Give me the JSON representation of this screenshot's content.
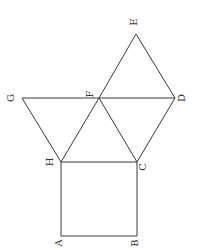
{
  "diagram": {
    "points": {
      "A": {
        "x": 61,
        "y": 236,
        "label": "A",
        "lx": 58,
        "ly": 243
      },
      "B": {
        "x": 137,
        "y": 236,
        "label": "B",
        "lx": 134,
        "ly": 243
      },
      "C": {
        "x": 137,
        "y": 162,
        "label": "C",
        "lx": 142,
        "ly": 167
      },
      "H": {
        "x": 61,
        "y": 162,
        "label": "H",
        "lx": 49,
        "ly": 162
      },
      "G": {
        "x": 22,
        "y": 98,
        "label": "G",
        "lx": 10,
        "ly": 98
      },
      "F": {
        "x": 99,
        "y": 98,
        "label": "F",
        "lx": 89,
        "ly": 94
      },
      "D": {
        "x": 175,
        "y": 98,
        "label": "D",
        "lx": 181,
        "ly": 98
      },
      "E": {
        "x": 136,
        "y": 34,
        "label": "E",
        "lx": 133,
        "ly": 22
      }
    },
    "segments": [
      [
        "A",
        "B"
      ],
      [
        "B",
        "C"
      ],
      [
        "C",
        "H"
      ],
      [
        "H",
        "A"
      ],
      [
        "G",
        "D"
      ],
      [
        "G",
        "H"
      ],
      [
        "H",
        "F"
      ],
      [
        "F",
        "C"
      ],
      [
        "C",
        "D"
      ],
      [
        "F",
        "E"
      ],
      [
        "E",
        "D"
      ]
    ]
  }
}
